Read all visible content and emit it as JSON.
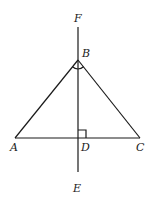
{
  "diagram": {
    "type": "geometry",
    "points": {
      "F": {
        "label": "F"
      },
      "B": {
        "label": "B"
      },
      "A": {
        "label": "A"
      },
      "D": {
        "label": "D"
      },
      "C": {
        "label": "C"
      },
      "E": {
        "label": "E"
      }
    },
    "segments": [
      {
        "from": "A",
        "to": "B"
      },
      {
        "from": "B",
        "to": "C"
      },
      {
        "from": "A",
        "to": "C"
      },
      {
        "from": "F",
        "to": "E"
      }
    ],
    "marks": [
      {
        "type": "angle-arc",
        "at": "B",
        "between": [
          "A",
          "C"
        ]
      },
      {
        "type": "right-angle",
        "at": "D",
        "between": [
          "B",
          "C"
        ]
      }
    ]
  }
}
